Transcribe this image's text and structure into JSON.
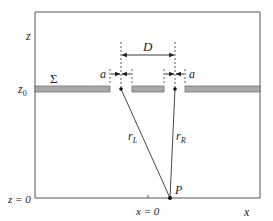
{
  "diagram": {
    "axes": {
      "z_label": "z",
      "x_label": "x",
      "z0_label": "z",
      "z0_sub": "0",
      "z_zero_label": "z = 0",
      "x_zero_label": "x = 0"
    },
    "screen": {
      "label": "Σ"
    },
    "slits": {
      "separation_label": "D",
      "left_width_label": "a",
      "right_width_label": "a"
    },
    "rays": {
      "left_label": "r",
      "left_sub": "L",
      "right_label": "r",
      "right_sub": "R"
    },
    "point": {
      "label": "P"
    },
    "colors": {
      "frame": "#555555",
      "screen_fill": "#a9a9a9",
      "screen_stroke": "#666666",
      "line": "#333333"
    }
  }
}
